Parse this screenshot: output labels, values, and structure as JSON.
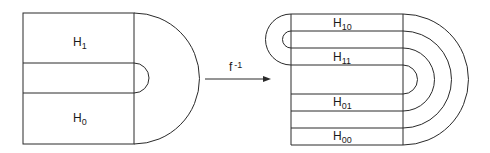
{
  "diagram": {
    "left_figure": {
      "regions": [
        {
          "label": "H",
          "subscript": "1"
        },
        {
          "label": "H",
          "subscript": "0"
        }
      ]
    },
    "arrow": {
      "label": "f",
      "superscript": "-1"
    },
    "right_figure": {
      "regions": [
        {
          "label": "H",
          "subscript": "10"
        },
        {
          "label": "H",
          "subscript": "11"
        },
        {
          "label": "H",
          "subscript": "01"
        },
        {
          "label": "H",
          "subscript": "00"
        }
      ]
    },
    "colors": {
      "line": "#2a2a2a",
      "background": "#ffffff"
    }
  }
}
